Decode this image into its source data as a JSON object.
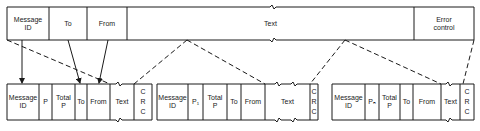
{
  "message": {
    "fields": [
      {
        "label": "Message\nID"
      },
      {
        "label": "To"
      },
      {
        "label": "From"
      },
      {
        "label": "Text"
      },
      {
        "label": "Error\ncontrol"
      }
    ]
  },
  "packets": [
    {
      "fields": [
        {
          "label": "Message\nID"
        },
        {
          "label": "P"
        },
        {
          "label": "Total\nP"
        },
        {
          "label": "To"
        },
        {
          "label": "From"
        },
        {
          "label": "Text"
        },
        {
          "label": "C\nR\nC"
        }
      ]
    },
    {
      "fields": [
        {
          "label": "Message\nID"
        },
        {
          "label": "P₁"
        },
        {
          "label": "Total\nP"
        },
        {
          "label": "To"
        },
        {
          "label": "From"
        },
        {
          "label": "Text"
        },
        {
          "label": "C\nR\nC"
        }
      ]
    },
    {
      "fields": [
        {
          "label": "Message\nID"
        },
        {
          "label": "Pₙ"
        },
        {
          "label": "Total\nP"
        },
        {
          "label": "To"
        },
        {
          "label": "From"
        },
        {
          "label": "Text"
        },
        {
          "label": "C\nR\nC"
        }
      ]
    }
  ],
  "colors": {
    "line": "#1a1a1a",
    "background": "#ffffff"
  }
}
